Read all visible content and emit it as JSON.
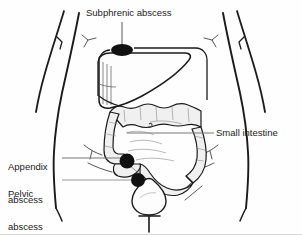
{
  "figure": {
    "background_color": "#fefefe",
    "ink_color": "#1b1b1b",
    "leader_color": "#777777",
    "organ_fill": "#f0f0f0",
    "width": 302,
    "height": 235
  },
  "labels": {
    "subphrenic": "Subphrenic abscess",
    "small_intestine": "Small intestine",
    "appendix_line1": "Appendix",
    "appendix_line2": "abscess",
    "pelvic_line1": "Pelvic",
    "pelvic_line2": "abscess"
  },
  "markers": [
    {
      "name": "subphrenic-abscess-marker",
      "label": "Subphrenic abscess",
      "shape": "ellipse",
      "cx": 122,
      "cy": 50,
      "rx": 11,
      "ry": 6,
      "color": "#111111"
    },
    {
      "name": "appendix-abscess-marker",
      "label": "Appendix abscess",
      "shape": "circle",
      "cx": 127,
      "cy": 161,
      "rx": 7.5,
      "ry": 7.5,
      "color": "#111111"
    },
    {
      "name": "pelvic-abscess-marker",
      "label": "Pelvic abscess",
      "shape": "circle",
      "cx": 138,
      "cy": 180,
      "rx": 7,
      "ry": 7,
      "color": "#111111"
    }
  ],
  "organs": [
    {
      "name": "liver",
      "visible": true
    },
    {
      "name": "transverse-colon",
      "visible": true
    },
    {
      "name": "ascending-colon",
      "visible": true
    },
    {
      "name": "descending-colon",
      "visible": true
    },
    {
      "name": "sigmoid-colon",
      "visible": true
    },
    {
      "name": "cecum",
      "visible": true
    },
    {
      "name": "small-intestine",
      "visible": true
    },
    {
      "name": "bladder",
      "visible": true
    },
    {
      "name": "urethra",
      "visible": true
    },
    {
      "name": "torso-outline",
      "visible": true
    },
    {
      "name": "left-arm",
      "visible": true
    },
    {
      "name": "right-arm",
      "visible": true
    }
  ]
}
